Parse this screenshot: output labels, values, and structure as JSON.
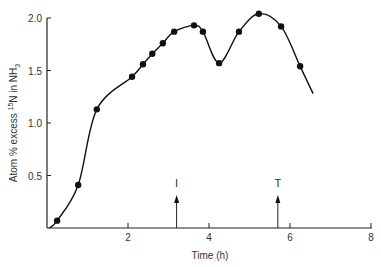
{
  "chart_data": {
    "type": "line",
    "title": "",
    "xlabel": "Time (h)",
    "ylabel_parts": {
      "pre": "Atom % excess ",
      "sup": "15",
      "mid": "N in NH",
      "sub": "3"
    },
    "ylabel": "Atom % excess 15N in NH3",
    "xlim": [
      0,
      8
    ],
    "ylim": [
      0,
      2.0
    ],
    "x_ticks": [
      2,
      4,
      6,
      8
    ],
    "x_tick_labels": [
      "2",
      "4",
      "6",
      "8"
    ],
    "y_ticks": [
      0.5,
      1.0,
      1.5,
      2.0
    ],
    "y_tick_labels": [
      "0.5",
      "1.0",
      "1.5",
      "2.0"
    ],
    "grid": false,
    "series": [
      {
        "name": "15N excess in NH3",
        "x": [
          0.25,
          0.77,
          1.23,
          2.1,
          2.37,
          2.6,
          2.86,
          3.14,
          3.63,
          3.85,
          4.25,
          4.74,
          5.23,
          5.78,
          6.25
        ],
        "y": [
          0.07,
          0.41,
          1.13,
          1.44,
          1.56,
          1.66,
          1.76,
          1.87,
          1.93,
          1.87,
          1.57,
          1.87,
          2.04,
          1.92,
          1.54
        ],
        "curve_end": {
          "x": 6.57,
          "y": 1.28
        }
      }
    ],
    "annotations": [
      {
        "label": "I",
        "x": 3.2,
        "type": "arrow-up"
      },
      {
        "label": "T",
        "x": 5.7,
        "type": "arrow-up"
      }
    ]
  }
}
